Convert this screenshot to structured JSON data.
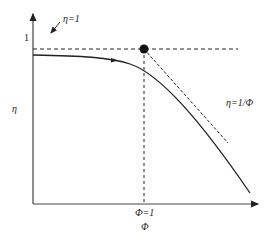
{
  "diagram": {
    "y_axis_label": "η",
    "x_axis_label": "Φ",
    "y_tick_label": "1",
    "x_tick_label": "Φ=1",
    "annotation_eta1": "η=1",
    "annotation_asymptote": "η=1/Φ",
    "colors": {
      "line": "#222222",
      "background": "#ffffff"
    }
  }
}
